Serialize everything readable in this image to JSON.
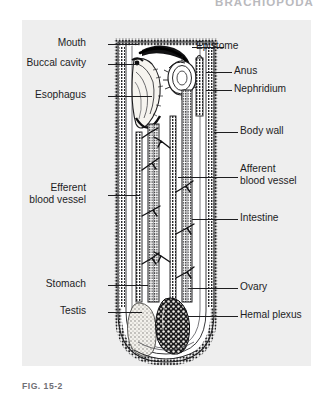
{
  "running_head": "BRACHIOPODA",
  "caption": "FIG. 15-2",
  "figure": {
    "background_color": "#eeeeee",
    "ink_color": "#1d1d1f"
  },
  "labels_left": [
    {
      "text": "Mouth",
      "name": "label-mouth"
    },
    {
      "text": "Buccal cavity",
      "name": "label-buccal-cavity"
    },
    {
      "text": "Esophagus",
      "name": "label-esophagus"
    },
    {
      "text": "Efferent",
      "name": "label-efferent-blood-vessel-line1"
    },
    {
      "text": "blood vessel",
      "name": "label-efferent-blood-vessel-line2"
    },
    {
      "text": "Stomach",
      "name": "label-stomach"
    },
    {
      "text": "Testis",
      "name": "label-testis"
    }
  ],
  "labels_right": [
    {
      "text": "Epistome",
      "name": "label-epistome"
    },
    {
      "text": "Anus",
      "name": "label-anus"
    },
    {
      "text": "Nephridium",
      "name": "label-nephridium"
    },
    {
      "text": "Body wall",
      "name": "label-body-wall"
    },
    {
      "text": "Afferent",
      "name": "label-afferent-blood-vessel-line1"
    },
    {
      "text": "blood vessel",
      "name": "label-afferent-blood-vessel-line2"
    },
    {
      "text": "Intestine",
      "name": "label-intestine"
    },
    {
      "text": "Ovary",
      "name": "label-ovary"
    },
    {
      "text": "Hemal plexus",
      "name": "label-hemal-plexus"
    }
  ]
}
